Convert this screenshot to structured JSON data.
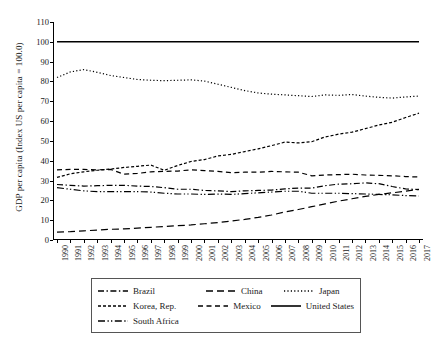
{
  "chart_data": {
    "type": "line",
    "title": "",
    "xlabel": "",
    "ylabel": "GDP per capita (Index US per capita = 100.0)",
    "ylim": [
      0,
      110
    ],
    "ytick_step": 10,
    "yticks": [
      0,
      10,
      20,
      30,
      40,
      50,
      60,
      70,
      80,
      90,
      100,
      110
    ],
    "grid": false,
    "legend_position": "bottom",
    "x": [
      1990,
      1991,
      1992,
      1993,
      1994,
      1995,
      1996,
      1997,
      1998,
      1999,
      2000,
      2001,
      2002,
      2003,
      2004,
      2005,
      2006,
      2007,
      2008,
      2009,
      2010,
      2011,
      2012,
      2013,
      2014,
      2015,
      2016,
      2017
    ],
    "categories": [
      "1990",
      "1991",
      "1992",
      "1993",
      "1994",
      "1995",
      "1996",
      "1997",
      "1998",
      "1999",
      "2000",
      "2001",
      "2002",
      "2003",
      "2004",
      "2005",
      "2006",
      "2007",
      "2008",
      "2009",
      "2010",
      "2011",
      "2012",
      "2013",
      "2014",
      "2015",
      "2016",
      "2017"
    ],
    "series": [
      {
        "name": "Brazil",
        "dash": "dash-dot",
        "values": [
          28.0,
          27.6,
          27.2,
          27.4,
          27.6,
          27.6,
          27.2,
          27.0,
          26.4,
          25.6,
          25.6,
          25.0,
          24.8,
          24.4,
          24.8,
          25.0,
          25.2,
          25.8,
          26.2,
          26.2,
          27.4,
          28.2,
          28.4,
          28.8,
          28.4,
          27.0,
          25.8,
          25.4
        ]
      },
      {
        "name": "China",
        "dash": "long-dash",
        "values": [
          4.0,
          4.2,
          4.6,
          5.0,
          5.4,
          5.6,
          6.0,
          6.4,
          6.8,
          7.2,
          7.6,
          8.2,
          8.8,
          9.6,
          10.4,
          11.4,
          12.6,
          14.2,
          15.4,
          16.8,
          18.2,
          19.6,
          20.8,
          22.0,
          23.0,
          23.8,
          24.6,
          25.6
        ]
      },
      {
        "name": "Japan",
        "dash": "dotted",
        "values": [
          82.0,
          84.8,
          86.0,
          84.6,
          83.0,
          82.0,
          81.0,
          80.6,
          80.4,
          80.6,
          80.8,
          80.2,
          78.6,
          77.0,
          75.4,
          74.2,
          73.6,
          73.2,
          72.8,
          72.4,
          73.2,
          73.0,
          73.4,
          72.6,
          72.0,
          71.6,
          72.2,
          72.6
        ]
      },
      {
        "name": "Korea, Rep.",
        "dash": "dashed",
        "values": [
          31.6,
          33.4,
          34.4,
          35.2,
          35.8,
          36.6,
          37.2,
          37.8,
          35.2,
          37.6,
          39.6,
          40.6,
          42.4,
          43.2,
          44.6,
          46.0,
          47.6,
          49.4,
          49.0,
          49.6,
          52.0,
          53.4,
          54.4,
          56.2,
          58.0,
          59.4,
          61.8,
          64.0
        ]
      },
      {
        "name": "Mexico",
        "dash": "dash",
        "values": [
          35.4,
          35.6,
          35.6,
          35.4,
          35.6,
          33.2,
          33.6,
          34.4,
          34.6,
          34.8,
          35.4,
          35.0,
          34.6,
          34.0,
          34.2,
          34.2,
          34.6,
          34.4,
          34.2,
          32.4,
          32.8,
          33.0,
          33.2,
          32.8,
          32.6,
          32.4,
          32.0,
          31.8
        ]
      },
      {
        "name": "United States",
        "dash": "solid",
        "values": [
          100.0,
          100.0,
          100.0,
          100.0,
          100.0,
          100.0,
          100.0,
          100.0,
          100.0,
          100.0,
          100.0,
          100.0,
          100.0,
          100.0,
          100.0,
          100.0,
          100.0,
          100.0,
          100.0,
          100.0,
          100.0,
          100.0,
          100.0,
          100.0,
          100.0,
          100.0,
          100.0,
          100.0
        ]
      },
      {
        "name": "South Africa",
        "dash": "dash-dot-dot",
        "values": [
          26.4,
          25.6,
          24.8,
          24.4,
          24.4,
          24.4,
          24.4,
          24.2,
          23.6,
          23.2,
          23.2,
          23.0,
          23.2,
          23.0,
          23.4,
          23.8,
          24.2,
          24.6,
          24.6,
          23.6,
          23.6,
          23.6,
          23.4,
          23.2,
          23.0,
          22.8,
          22.4,
          22.2
        ]
      }
    ]
  },
  "legend": {
    "rows": [
      [
        {
          "label": "Brazil",
          "dash": "dash-dot"
        },
        {
          "label": "China",
          "dash": "long-dash"
        },
        {
          "label": "Japan",
          "dash": "dotted"
        }
      ],
      [
        {
          "label": "Korea, Rep.",
          "dash": "dashed"
        },
        {
          "label": "Mexico",
          "dash": "dash"
        },
        {
          "label": "United States",
          "dash": "solid"
        }
      ],
      [
        {
          "label": "South Africa",
          "dash": "dash-dot-dot"
        }
      ]
    ]
  },
  "colors": {
    "line": "#000000",
    "axis": "#000000",
    "legend_border": "#555555",
    "background": "#ffffff"
  }
}
